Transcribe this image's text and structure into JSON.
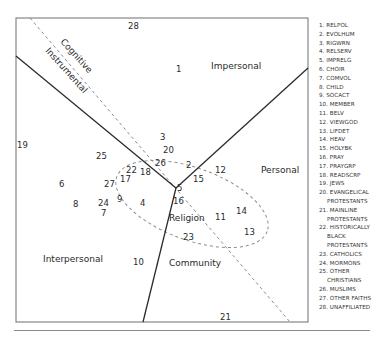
{
  "diagram": {
    "regions": {
      "impersonal": "Impersonal",
      "personal": "Personal",
      "interpersonal": "Interpersonal",
      "community": "Community",
      "religion": "Religion",
      "cognitive": "Cognitive",
      "instrumental": "Instrumental"
    },
    "points": [
      {
        "id": "1",
        "x": 176,
        "y": 72
      },
      {
        "id": "2",
        "x": 186,
        "y": 168
      },
      {
        "id": "3",
        "x": 160,
        "y": 140
      },
      {
        "id": "4",
        "x": 140,
        "y": 206
      },
      {
        "id": "5",
        "x": 177,
        "y": 191
      },
      {
        "id": "6",
        "x": 59,
        "y": 187
      },
      {
        "id": "7",
        "x": 101,
        "y": 216
      },
      {
        "id": "8",
        "x": 73,
        "y": 207
      },
      {
        "id": "9",
        "x": 117,
        "y": 202
      },
      {
        "id": "10",
        "x": 133,
        "y": 265
      },
      {
        "id": "11",
        "x": 215,
        "y": 220
      },
      {
        "id": "12",
        "x": 215,
        "y": 173
      },
      {
        "id": "13",
        "x": 244,
        "y": 235
      },
      {
        "id": "14",
        "x": 236,
        "y": 214
      },
      {
        "id": "15",
        "x": 193,
        "y": 182
      },
      {
        "id": "16",
        "x": 173,
        "y": 204
      },
      {
        "id": "17",
        "x": 120,
        "y": 182
      },
      {
        "id": "18",
        "x": 140,
        "y": 175
      },
      {
        "id": "19",
        "x": 17,
        "y": 148
      },
      {
        "id": "20",
        "x": 163,
        "y": 153
      },
      {
        "id": "21",
        "x": 220,
        "y": 320
      },
      {
        "id": "22",
        "x": 126,
        "y": 173
      },
      {
        "id": "23",
        "x": 183,
        "y": 240
      },
      {
        "id": "24",
        "x": 98,
        "y": 206
      },
      {
        "id": "25",
        "x": 96,
        "y": 159
      },
      {
        "id": "26",
        "x": 155,
        "y": 166
      },
      {
        "id": "27",
        "x": 104,
        "y": 187
      },
      {
        "id": "28",
        "x": 128,
        "y": 29
      }
    ]
  },
  "legend": {
    "items": [
      {
        "label": "1. RELPOL"
      },
      {
        "label": "2. EVOLHUM"
      },
      {
        "label": "3. RIGWRN"
      },
      {
        "label": "4. RELSERV"
      },
      {
        "label": "5. IMPRELG"
      },
      {
        "label": "6. CHOIR"
      },
      {
        "label": "7. COMVOL"
      },
      {
        "label": "8. CHILD"
      },
      {
        "label": "9. SOCACT"
      },
      {
        "label": "10. MEMBER"
      },
      {
        "label": "11. BELV"
      },
      {
        "label": "12. VIEWGOD"
      },
      {
        "label": "13. LIFDET"
      },
      {
        "label": "14. HEAV"
      },
      {
        "label": "15. HOLYBK"
      },
      {
        "label": "16. PRAY"
      },
      {
        "label": "17. PRAYGRP"
      },
      {
        "label": "18. READSCRP"
      },
      {
        "label": "19. JEWS"
      },
      {
        "label": "20. EVANGELICAL",
        "cont": [
          "PROTESTANTS"
        ]
      },
      {
        "label": "21. MAINLINE",
        "cont": [
          "PROTESTANTS"
        ]
      },
      {
        "label": "22. HISTORICALLY",
        "cont": [
          "BLACK",
          "PROTESTANTS"
        ]
      },
      {
        "label": "23. CATHOLICS"
      },
      {
        "label": "24. MORMONS"
      },
      {
        "label": "25. OTHER",
        "cont": [
          "CHRISTIANS"
        ]
      },
      {
        "label": "26. MUSLIMS"
      },
      {
        "label": "27. OTHER FAITHS"
      },
      {
        "label": "28. UNAFFILIATED"
      }
    ]
  },
  "colors": {
    "line": "#2b2b2b",
    "dashed": "#8c8c8c",
    "frame": "#6e6e6e"
  }
}
